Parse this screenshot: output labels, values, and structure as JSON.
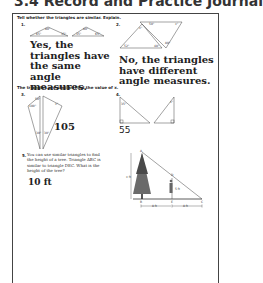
{
  "header": {
    "title": "3.4 Record and Practice Journal"
  },
  "section1": {
    "instruction": "Tell whether the triangles are similar. Explain.",
    "problems": [
      {
        "number": "1.",
        "angles": [
          "65°",
          "80°",
          "35°",
          "65°",
          "80°",
          "35°"
        ],
        "answer": "Yes, the triangles have the same angle measures."
      },
      {
        "number": "2.",
        "angles": [
          "x°",
          "50°",
          "x°",
          "52°",
          "48°",
          "80°"
        ],
        "answer": "No, the triangles have different angle measures."
      }
    ]
  },
  "section2": {
    "instruction": "The triangles are similar. Find the value of x.",
    "problems": [
      {
        "number": "3.",
        "angles": [
          "50°",
          "100°",
          "x°",
          "30°",
          "30°"
        ],
        "answer": "105"
      },
      {
        "number": "4.",
        "angles": [
          "35°",
          "x°"
        ],
        "answer": "55"
      }
    ]
  },
  "problem5": {
    "number": "5.",
    "text": "You can use similar triangles to find the height of a tree. Triangle ABC is similar to triangle DEC. What is the height of the tree?",
    "answer": "10 ft",
    "figure": {
      "labels": {
        "A": "A",
        "B": "B",
        "C": "C",
        "D": "D",
        "E": "E"
      },
      "tree_height": "x ft",
      "person_height": "5 ft",
      "distance_BE": "8 ft",
      "distance_EC": "8 ft"
    }
  }
}
